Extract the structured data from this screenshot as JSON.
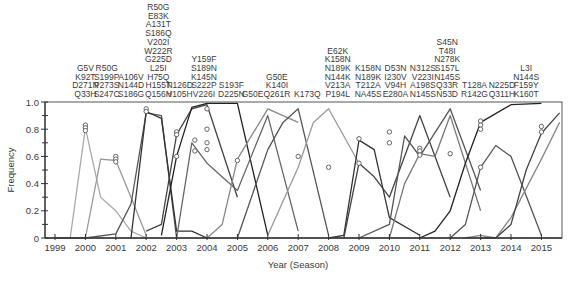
{
  "chart_data": {
    "type": "line",
    "title": "",
    "xlabel": "Year (Season)",
    "ylabel": "Frequency",
    "ylim": [
      0,
      1.0
    ],
    "xlim": [
      1999,
      2015.7
    ],
    "yticks": [
      "0",
      "0.2",
      "0.4",
      "0.6",
      "0.8",
      "1.0"
    ],
    "xticks": [
      "1999",
      "2000",
      "2001",
      "2002",
      "2003",
      "2004",
      "2005",
      "2006",
      "2007",
      "2008",
      "2009",
      "2010",
      "2011",
      "2012",
      "2013",
      "2014",
      "2015"
    ],
    "grid": false,
    "legend": "none",
    "mutation_annotations": [
      {
        "x": 2000.0,
        "labels": [
          "G5V",
          "K92T",
          "D271N",
          "Q33H"
        ]
      },
      {
        "x": 2000.7,
        "labels": [
          "R50G",
          "S199P",
          "P273S",
          "S247C"
        ]
      },
      {
        "x": 2001.5,
        "labels": [
          "A106V",
          "N144D",
          "S186G"
        ]
      },
      {
        "x": 2002.4,
        "labels": [
          "R50G",
          "E83K",
          "A131T",
          "S186Q",
          "V202I",
          "W222R",
          "G225D",
          "L25I",
          "H75Q",
          "H155T",
          "Q156H"
        ]
      },
      {
        "x": 2003.1,
        "labels": [
          "N126D",
          "V105H"
        ]
      },
      {
        "x": 2003.9,
        "labels": [
          "Y159F",
          "S189N",
          "K145N",
          "S222P",
          "V226I"
        ]
      },
      {
        "x": 2004.8,
        "labels": [
          "S193F",
          "D225N"
        ]
      },
      {
        "x": 2005.5,
        "labels": [
          "G50E"
        ]
      },
      {
        "x": 2006.3,
        "labels": [
          "G50E",
          "K140I",
          "Q261R"
        ]
      },
      {
        "x": 2007.3,
        "labels": [
          "K173Q"
        ]
      },
      {
        "x": 2008.3,
        "labels": [
          "E62K",
          "K158N",
          "N189K",
          "N144K",
          "V213A",
          "P194L"
        ]
      },
      {
        "x": 2009.3,
        "labels": [
          "K158N",
          "N189K",
          "T212A",
          "NA45S"
        ]
      },
      {
        "x": 2010.2,
        "labels": [
          "D53N",
          "I230V",
          "V94H",
          "E280A"
        ]
      },
      {
        "x": 2011.1,
        "labels": [
          "N312S",
          "V223I",
          "A198S",
          "N145S"
        ]
      },
      {
        "x": 2011.9,
        "labels": [
          "S45N",
          "T48I",
          "N278K",
          "S157L",
          "N145S",
          "Q33R",
          "N53D"
        ]
      },
      {
        "x": 2012.8,
        "labels": [
          "T128A",
          "R142G"
        ]
      },
      {
        "x": 2013.7,
        "labels": [
          "N225D",
          "Q311H"
        ]
      },
      {
        "x": 2014.5,
        "labels": [
          "L3I",
          "N144S",
          "F159Y",
          "K160T"
        ]
      }
    ],
    "series": [
      {
        "name": "G5V/K92T/D271N/Q33H",
        "shade": "#aaaaaa",
        "x": [
          1999.5,
          2000.0,
          2000.5,
          2001.0,
          2001.5,
          2002.0
        ],
        "values": [
          0.0,
          0.81,
          0.3,
          0.2,
          0.05,
          0.0
        ]
      },
      {
        "name": "R50G/S199P/P273S/S247C",
        "shade": "#999999",
        "x": [
          2000.0,
          2000.5,
          2001.0,
          2001.5,
          2002.0
        ],
        "values": [
          0.0,
          0.58,
          0.57,
          0.3,
          0.02
        ]
      },
      {
        "name": "A106V/N144D/S186G",
        "shade": "#555555",
        "x": [
          1999.0,
          2000.0,
          2001.0,
          2001.5,
          2002.0,
          2002.5,
          2003.0
        ],
        "values": [
          0.0,
          0.0,
          0.03,
          0.25,
          0.92,
          0.9,
          0.0
        ]
      },
      {
        "name": "R50G/E83K/... (2002)",
        "shade": "#333333",
        "x": [
          2001.5,
          2002.0,
          2002.5,
          2003.0,
          2003.5,
          2004.0
        ],
        "values": [
          0.0,
          0.93,
          0.88,
          0.05,
          0.05,
          0.0
        ]
      },
      {
        "name": "N126D/V105H",
        "shade": "#444444",
        "x": [
          2002.0,
          2002.5,
          2003.0,
          2003.5,
          2004.0,
          2005.0
        ],
        "values": [
          0.05,
          0.1,
          0.76,
          0.95,
          0.98,
          0.3
        ]
      },
      {
        "name": "Y159F/S189N/K145N/S222P/V226I",
        "shade": "#222222",
        "x": [
          2002.5,
          2003.0,
          2003.5,
          2004.0,
          2005.0,
          2006.0
        ],
        "values": [
          0.02,
          0.6,
          0.96,
          0.99,
          0.99,
          0.02
        ]
      },
      {
        "name": "S193F/D225N",
        "shade": "#666666",
        "x": [
          2003.0,
          2003.5,
          2004.0,
          2005.0,
          2006.0,
          2007.0
        ],
        "values": [
          0.0,
          0.7,
          0.55,
          0.35,
          0.9,
          0.05
        ]
      },
      {
        "name": "G50E",
        "shade": "#888888",
        "x": [
          2004.0,
          2004.5,
          2005.0,
          2006.0,
          2007.0
        ],
        "values": [
          0.0,
          0.1,
          0.58,
          0.95,
          0.85
        ]
      },
      {
        "name": "G50E/K140I/Q261R",
        "shade": "#555555",
        "x": [
          2005.0,
          2006.0,
          2006.5,
          2007.0,
          2008.0
        ],
        "values": [
          0.0,
          0.65,
          0.85,
          0.95,
          0.02
        ]
      },
      {
        "name": "K173Q",
        "shade": "#999999",
        "x": [
          2006.0,
          2007.0,
          2007.5,
          2008.0,
          2009.0
        ],
        "values": [
          0.02,
          0.52,
          0.85,
          0.95,
          0.55
        ]
      },
      {
        "name": "E62K/K158N/N189K/N144K/V213A/P194L",
        "shade": "#333333",
        "x": [
          2008.0,
          2008.5,
          2009.0,
          2009.5,
          2010.0,
          2011.0
        ],
        "values": [
          0.0,
          0.02,
          0.72,
          0.65,
          0.15,
          0.02
        ]
      },
      {
        "name": "K158N/N189K/T212A/NA45S",
        "shade": "#444444",
        "x": [
          2008.5,
          2009.0,
          2009.5,
          2010.0,
          2011.0,
          2012.0
        ],
        "values": [
          0.0,
          0.55,
          0.45,
          0.3,
          0.9,
          0.3
        ]
      },
      {
        "name": "D53N/I230V/V94H/E280A",
        "shade": "#555555",
        "x": [
          2009.0,
          2010.0,
          2010.5,
          2011.0,
          2012.0,
          2013.0
        ],
        "values": [
          0.0,
          0.1,
          0.75,
          0.6,
          0.95,
          0.35
        ]
      },
      {
        "name": "N312S/V223I/A198S/N145S",
        "shade": "#777777",
        "x": [
          2010.0,
          2010.5,
          2011.0,
          2011.5,
          2012.0,
          2013.0
        ],
        "values": [
          0.0,
          0.4,
          0.62,
          0.6,
          0.9,
          0.2
        ]
      },
      {
        "name": "S45N/T48I/N278K/S157L/N145S/Q33R/N53D",
        "shade": "#222222",
        "x": [
          2011.0,
          2011.5,
          2012.0,
          2012.5,
          2013.0,
          2014.0,
          2015.0
        ],
        "values": [
          0.0,
          0.05,
          0.2,
          0.55,
          0.85,
          0.98,
          0.99
        ]
      },
      {
        "name": "T128A/R142G",
        "shade": "#555555",
        "x": [
          2012.0,
          2012.5,
          2013.0,
          2013.5,
          2014.0,
          2015.0
        ],
        "values": [
          0.0,
          0.1,
          0.52,
          0.68,
          0.6,
          0.02
        ]
      },
      {
        "name": "N225D/Q311H",
        "shade": "#888888",
        "x": [
          2012.5,
          2013.0,
          2013.5,
          2014.0,
          2015.0,
          2015.6
        ],
        "values": [
          0.0,
          0.02,
          0.0,
          0.15,
          0.58,
          0.85
        ]
      },
      {
        "name": "L3I/N144S/F159Y/K160T",
        "shade": "#444444",
        "x": [
          2013.0,
          2013.5,
          2014.0,
          2014.5,
          2015.0,
          2015.6
        ],
        "values": [
          0.0,
          0.0,
          0.1,
          0.5,
          0.77,
          0.92
        ]
      }
    ],
    "markers": [
      {
        "x": 2000.0,
        "y": 0.83
      },
      {
        "x": 2000.0,
        "y": 0.81
      },
      {
        "x": 2000.0,
        "y": 0.79
      },
      {
        "x": 2001.0,
        "y": 0.6
      },
      {
        "x": 2001.0,
        "y": 0.58
      },
      {
        "x": 2001.0,
        "y": 0.56
      },
      {
        "x": 2002.0,
        "y": 0.95
      },
      {
        "x": 2002.0,
        "y": 0.93
      },
      {
        "x": 2003.0,
        "y": 0.78
      },
      {
        "x": 2003.0,
        "y": 0.76
      },
      {
        "x": 2003.0,
        "y": 0.6
      },
      {
        "x": 2003.6,
        "y": 0.72
      },
      {
        "x": 2003.6,
        "y": 0.64
      },
      {
        "x": 2004.0,
        "y": 0.95
      },
      {
        "x": 2004.0,
        "y": 0.8
      },
      {
        "x": 2004.0,
        "y": 0.7
      },
      {
        "x": 2004.0,
        "y": 0.65
      },
      {
        "x": 2005.0,
        "y": 0.57
      },
      {
        "x": 2007.0,
        "y": 0.6
      },
      {
        "x": 2008.0,
        "y": 0.52
      },
      {
        "x": 2009.0,
        "y": 0.73
      },
      {
        "x": 2009.0,
        "y": 0.55
      },
      {
        "x": 2010.0,
        "y": 0.78
      },
      {
        "x": 2010.0,
        "y": 0.7
      },
      {
        "x": 2011.0,
        "y": 0.66
      },
      {
        "x": 2011.0,
        "y": 0.64
      },
      {
        "x": 2011.0,
        "y": 0.61
      },
      {
        "x": 2012.0,
        "y": 0.62
      },
      {
        "x": 2013.0,
        "y": 0.86
      },
      {
        "x": 2013.0,
        "y": 0.83
      },
      {
        "x": 2013.0,
        "y": 0.8
      },
      {
        "x": 2013.0,
        "y": 0.52
      },
      {
        "x": 2015.0,
        "y": 0.82
      },
      {
        "x": 2015.0,
        "y": 0.78
      }
    ]
  }
}
